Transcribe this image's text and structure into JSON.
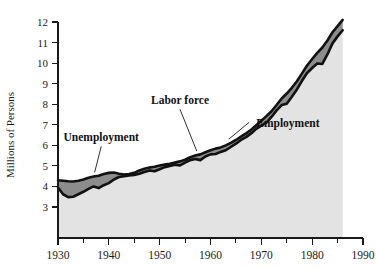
{
  "chart_data": {
    "type": "area",
    "title": "",
    "subtitle": "",
    "xlabel": "",
    "ylabel": "Millions of Persons",
    "xlim": [
      1930,
      1990
    ],
    "ylim": [
      2.55,
      12.45
    ],
    "grid": false,
    "legend_position": "inline-annotations",
    "x_ticks_major": [
      1930,
      1940,
      1950,
      1960,
      1970,
      1980,
      1990
    ],
    "x_ticks_minor": [
      1935,
      1945,
      1955,
      1965,
      1975,
      1985
    ],
    "y_ticks": [
      3,
      4,
      5,
      6,
      7,
      8,
      9,
      10,
      11,
      12
    ],
    "colors": {
      "labor_force_band": "#8c8c8c",
      "employment_area": "#e3e3e3",
      "outline": "#111111",
      "axis": "#1a1a1a",
      "background": "#ffffff"
    },
    "annotations": [
      {
        "text": "Unemployment",
        "x": 1938.5,
        "y": 6.2
      },
      {
        "text": "Labor force",
        "x": 1954.0,
        "y": 8.0
      },
      {
        "text": "Employment",
        "x": 1969.0,
        "y": 6.9
      }
    ],
    "x": [
      1930,
      1931,
      1932,
      1933,
      1934,
      1935,
      1936,
      1937,
      1938,
      1939,
      1940,
      1941,
      1942,
      1943,
      1944,
      1945,
      1946,
      1947,
      1948,
      1949,
      1950,
      1951,
      1952,
      1953,
      1954,
      1955,
      1956,
      1957,
      1958,
      1959,
      1960,
      1961,
      1962,
      1963,
      1964,
      1965,
      1966,
      1967,
      1968,
      1969,
      1970,
      1971,
      1972,
      1973,
      1974,
      1975,
      1976,
      1977,
      1978,
      1979,
      1980,
      1981,
      1982,
      1983,
      1984,
      1985,
      1986
    ],
    "series": [
      {
        "name": "Labor force",
        "values": [
          4.3,
          4.28,
          4.25,
          4.24,
          4.28,
          4.34,
          4.42,
          4.48,
          4.52,
          4.6,
          4.66,
          4.68,
          4.62,
          4.58,
          4.6,
          4.66,
          4.78,
          4.86,
          4.92,
          4.96,
          5.02,
          5.06,
          5.1,
          5.16,
          5.22,
          5.3,
          5.42,
          5.5,
          5.56,
          5.66,
          5.76,
          5.84,
          5.9,
          6.0,
          6.12,
          6.26,
          6.42,
          6.58,
          6.76,
          6.98,
          7.2,
          7.42,
          7.66,
          7.96,
          8.28,
          8.52,
          8.8,
          9.12,
          9.5,
          9.88,
          10.2,
          10.5,
          10.76,
          11.1,
          11.5,
          11.8,
          12.1
        ]
      },
      {
        "name": "Employment",
        "values": [
          3.95,
          3.62,
          3.48,
          3.5,
          3.62,
          3.74,
          3.88,
          4.0,
          3.92,
          4.06,
          4.16,
          4.34,
          4.46,
          4.5,
          4.54,
          4.56,
          4.62,
          4.7,
          4.78,
          4.74,
          4.84,
          4.94,
          5.0,
          5.06,
          5.02,
          5.16,
          5.28,
          5.34,
          5.28,
          5.46,
          5.56,
          5.58,
          5.68,
          5.76,
          5.92,
          6.08,
          6.26,
          6.4,
          6.58,
          6.8,
          6.96,
          7.1,
          7.38,
          7.7,
          7.96,
          8.02,
          8.36,
          8.72,
          9.14,
          9.52,
          9.76,
          9.98,
          9.96,
          10.42,
          10.96,
          11.3,
          11.6
        ]
      }
    ]
  }
}
